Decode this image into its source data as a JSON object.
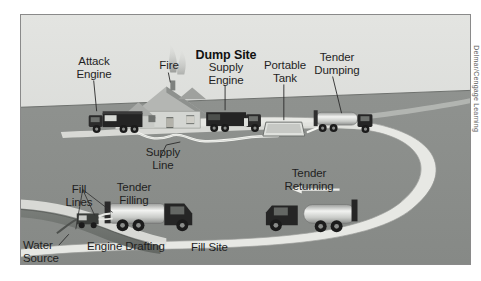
{
  "figure": {
    "title": "Dump Site",
    "credit": "Delmar/Cengage Learning",
    "background_color": "#cfd1cf",
    "ground_color": "#8c8f8c",
    "sky_color": "#d8dad7",
    "road_color": "#e9eae6",
    "water_color": "#6f736f",
    "border_color": "#8a8a8a",
    "truck_color": "#2a2a2a",
    "tank_color": "#d6d8d6",
    "hose_color": "#f4f5f1"
  },
  "labels": {
    "dump_site": "Dump Site",
    "attack_engine": "Attack\nEngine",
    "fire": "Fire",
    "supply_engine": "Supply\nEngine",
    "portable_tank": "Portable\nTank",
    "tender_dumping": "Tender\nDumping",
    "supply_line": "Supply\nLine",
    "tender_returning": "Tender\nReturning",
    "fill_lines": "Fill\nLines",
    "tender_filling": "Tender\nFilling",
    "water_source": "Water\nSource",
    "engine_drafting": "Engine Drafting",
    "fill_site": "Fill Site"
  },
  "diagram_elements": [
    {
      "name": "attack-engine",
      "type": "fire-apparatus",
      "label": "Attack Engine"
    },
    {
      "name": "house-fire",
      "type": "structure-fire",
      "label": "Fire"
    },
    {
      "name": "supply-engine",
      "type": "fire-apparatus",
      "label": "Supply Engine"
    },
    {
      "name": "portable-tank",
      "type": "portable-water-tank",
      "label": "Portable Tank"
    },
    {
      "name": "tender-dumping",
      "type": "water-tender",
      "label": "Tender Dumping"
    },
    {
      "name": "supply-line",
      "type": "hose-line",
      "label": "Supply Line"
    },
    {
      "name": "tender-returning",
      "type": "water-tender",
      "label": "Tender Returning"
    },
    {
      "name": "tender-filling",
      "type": "water-tender",
      "label": "Tender Filling"
    },
    {
      "name": "engine-drafting",
      "type": "fire-apparatus",
      "label": "Engine Drafting"
    },
    {
      "name": "fill-lines",
      "type": "hose-line",
      "label": "Fill Lines"
    },
    {
      "name": "water-source",
      "type": "static-water-supply",
      "label": "Water Source"
    },
    {
      "name": "fill-site",
      "type": "site-area",
      "label": "Fill Site"
    },
    {
      "name": "dump-site",
      "type": "site-area",
      "label": "Dump Site"
    }
  ]
}
